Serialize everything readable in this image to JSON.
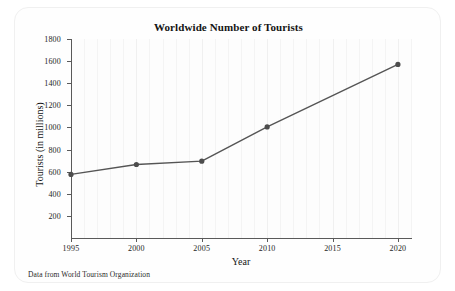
{
  "chart_data": {
    "type": "line",
    "title": "Worldwide Number of Tourists",
    "xlabel": "Year",
    "ylabel": "Tourists (in millions)",
    "source_note": "Data from World Tourism Organization",
    "x": [
      1995,
      2000,
      2005,
      2010,
      2020
    ],
    "values": [
      575,
      665,
      695,
      1005,
      1570
    ],
    "series": [
      {
        "name": "Worldwide tourists",
        "x": [
          1995,
          2000,
          2005,
          2010,
          2020
        ],
        "values": [
          575,
          665,
          695,
          1005,
          1570
        ]
      }
    ],
    "xlim": [
      1995,
      2021
    ],
    "ylim": [
      0,
      1800
    ],
    "xticks": [
      1995,
      2000,
      2005,
      2010,
      2015,
      2020
    ],
    "xtick_labels": [
      "1995",
      "2000",
      "2005",
      "2010",
      "2015",
      "2020"
    ],
    "yticks": [
      200,
      400,
      600,
      800,
      1000,
      1200,
      1400,
      1600,
      1800
    ],
    "ytick_labels": [
      "200",
      "400",
      "600",
      "800",
      "1000",
      "1200",
      "1400",
      "1600",
      "1800"
    ],
    "gridlines": {
      "vertical": true,
      "horizontal": false,
      "vertical_step": 1
    },
    "legend": {
      "visible": false,
      "position": "none"
    },
    "line_color": "#555555",
    "marker_color": "#4d4d4d",
    "marker_shape": "circle",
    "axis_color": "#5a5a5a"
  }
}
